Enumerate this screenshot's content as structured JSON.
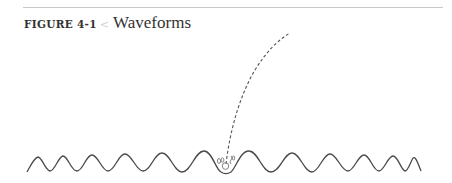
{
  "figure": {
    "label": "FIGURE 4-1",
    "marker": "<",
    "title": "Waveforms"
  },
  "diagram": {
    "stroke_color": "#4a4a4a",
    "rule_color": "#c8c8c8",
    "dashed_line_color": "#555555"
  }
}
